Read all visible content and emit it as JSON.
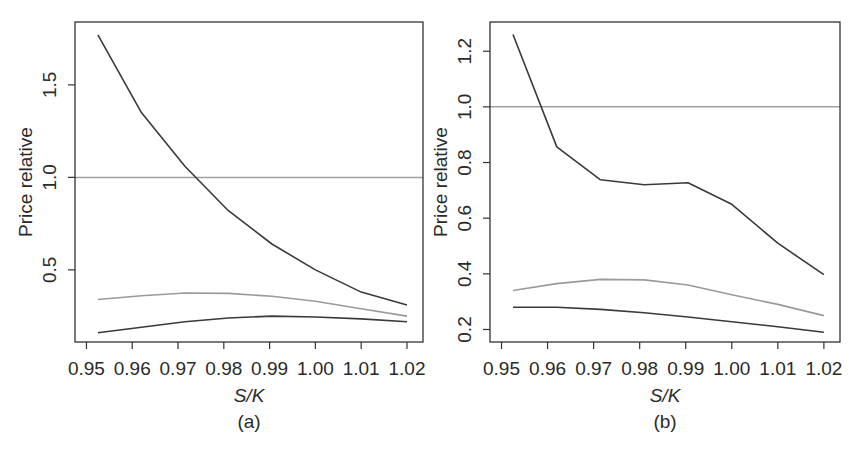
{
  "colors": {
    "frame": "#333333",
    "dark_series": "#3a3a3a",
    "gray_series": "#9a9a9a",
    "reference_line": "#a0a0a0",
    "text": "#2a2a2a",
    "background": "#ffffff"
  },
  "chart_data": [
    {
      "type": "line",
      "panel_label": "(a)",
      "title": "",
      "xlabel": "S/K",
      "ylabel": "Price relative",
      "xlim": [
        0.9475,
        1.0235
      ],
      "ylim": [
        0.11,
        1.84
      ],
      "grid": false,
      "legend": null,
      "xticks": [
        0.95,
        0.96,
        0.97,
        0.98,
        0.99,
        1.0,
        1.01,
        1.02
      ],
      "xtick_labels": [
        "0.95",
        "0.96",
        "0.97",
        "0.98",
        "0.99",
        "1.00",
        "1.01",
        "1.02"
      ],
      "yticks": [
        0.5,
        1.0,
        1.5
      ],
      "ytick_labels": [
        "0.5",
        "1.0",
        "1.5"
      ],
      "reference_line": {
        "y": 1.0
      },
      "x": [
        0.9525,
        0.962,
        0.9715,
        0.981,
        0.9905,
        1.0,
        1.01,
        1.02
      ],
      "series": [
        {
          "name": "dark-upper",
          "style": "dark",
          "values": [
            1.77,
            1.35,
            1.06,
            0.82,
            0.64,
            0.5,
            0.38,
            0.31
          ]
        },
        {
          "name": "gray-middle",
          "style": "gray",
          "values": [
            0.34,
            0.36,
            0.375,
            0.373,
            0.357,
            0.33,
            0.29,
            0.25
          ]
        },
        {
          "name": "dark-lower",
          "style": "dark",
          "values": [
            0.16,
            0.19,
            0.22,
            0.24,
            0.25,
            0.245,
            0.235,
            0.22
          ]
        }
      ]
    },
    {
      "type": "line",
      "panel_label": "(b)",
      "title": "",
      "xlabel": "S/K",
      "ylabel": "Price relative",
      "xlim": [
        0.9475,
        1.0235
      ],
      "ylim": [
        0.155,
        1.305
      ],
      "grid": false,
      "legend": null,
      "xticks": [
        0.95,
        0.96,
        0.97,
        0.98,
        0.99,
        1.0,
        1.01,
        1.02
      ],
      "xtick_labels": [
        "0.95",
        "0.96",
        "0.97",
        "0.98",
        "0.99",
        "1.00",
        "1.01",
        "1.02"
      ],
      "yticks": [
        0.2,
        0.4,
        0.6,
        0.8,
        1.0,
        1.2
      ],
      "ytick_labels": [
        "0.2",
        "0.4",
        "0.6",
        "0.8",
        "1.0",
        "1.2"
      ],
      "reference_line": {
        "y": 1.0
      },
      "x": [
        0.9525,
        0.962,
        0.9715,
        0.981,
        0.9905,
        1.0,
        1.01,
        1.02
      ],
      "series": [
        {
          "name": "dark-upper",
          "style": "dark",
          "values": [
            1.26,
            0.856,
            0.738,
            0.72,
            0.727,
            0.65,
            0.51,
            0.397
          ]
        },
        {
          "name": "gray-middle",
          "style": "gray",
          "values": [
            0.34,
            0.365,
            0.38,
            0.378,
            0.36,
            0.325,
            0.29,
            0.25
          ]
        },
        {
          "name": "dark-lower",
          "style": "dark",
          "values": [
            0.28,
            0.28,
            0.272,
            0.26,
            0.245,
            0.228,
            0.21,
            0.19
          ]
        }
      ]
    }
  ],
  "layout": {
    "panels": [
      {
        "frame": {
          "x0": 75,
          "y0": 22,
          "x1": 423,
          "y1": 342
        },
        "ylabel_x": 32,
        "ytick_label_x": 56,
        "xtick_label_y": 375,
        "xlabel_y": 402,
        "panel_label_y": 428
      },
      {
        "frame": {
          "x0": 490,
          "y0": 22,
          "x1": 840,
          "y1": 342
        },
        "ylabel_x": 447,
        "ytick_label_x": 471,
        "xtick_label_y": 375,
        "xlabel_y": 402,
        "panel_label_y": 428
      }
    ]
  }
}
